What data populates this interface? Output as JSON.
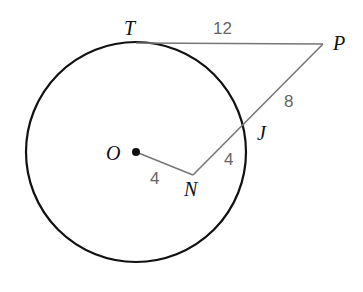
{
  "diagram": {
    "type": "geometry",
    "circle": {
      "center_label": "O",
      "cx": 136,
      "cy": 152,
      "r": 110
    },
    "points": {
      "T": {
        "label": "T",
        "x": 136,
        "y": 43
      },
      "P": {
        "label": "P",
        "x": 323,
        "y": 44
      },
      "J": {
        "label": "J",
        "x": 246,
        "y": 124
      },
      "N": {
        "label": "N",
        "x": 193,
        "y": 175
      },
      "O": {
        "label": "O",
        "x": 136,
        "y": 152
      }
    },
    "segments": [
      {
        "from": "T",
        "to": "P",
        "length_label": "12"
      },
      {
        "from": "P",
        "to": "J",
        "length_label": "8"
      },
      {
        "from": "J",
        "to": "N",
        "length_label": "4"
      },
      {
        "from": "O",
        "to": "N",
        "length_label": "4"
      }
    ],
    "colors": {
      "circle": "#111111",
      "segment": "#777777",
      "length_text": "#666666"
    }
  }
}
